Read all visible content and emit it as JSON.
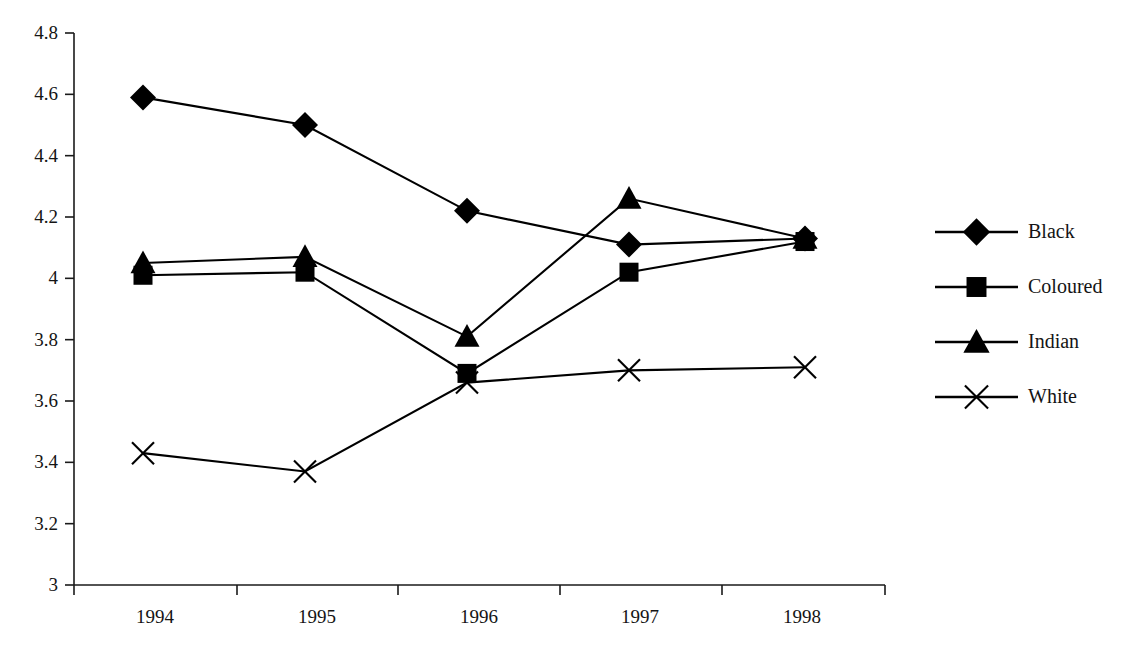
{
  "chart_data": {
    "type": "line",
    "title": "",
    "subtitle": "",
    "xlabel": "",
    "ylabel": "",
    "categories": [
      "1994",
      "1995",
      "1996",
      "1997",
      "1998"
    ],
    "x_tick_labels": [
      "1994",
      "1995",
      "1996",
      "1997",
      "1998"
    ],
    "y_tick_labels": [
      "3",
      "3.2",
      "3.4",
      "3.6",
      "3.8",
      "4",
      "4.2",
      "4.4",
      "4.6",
      "4.8"
    ],
    "y_ticks": [
      3,
      3.2,
      3.4,
      3.6,
      3.8,
      4,
      4.2,
      4.4,
      4.6,
      4.8
    ],
    "ylim": [
      3,
      4.8
    ],
    "grid": false,
    "legend_position": "right",
    "series": [
      {
        "name": "Black",
        "marker": "diamond",
        "values": [
          4.59,
          4.5,
          4.22,
          4.11,
          4.13
        ]
      },
      {
        "name": "Coloured",
        "marker": "square",
        "values": [
          4.01,
          4.02,
          3.69,
          4.02,
          4.12
        ]
      },
      {
        "name": "Indian",
        "marker": "triangle",
        "values": [
          4.05,
          4.07,
          3.81,
          4.26,
          4.13
        ]
      },
      {
        "name": "White",
        "marker": "x",
        "values": [
          3.43,
          3.37,
          3.66,
          3.7,
          3.71
        ]
      }
    ],
    "colors": {
      "series": "#000000",
      "axis": "#1a1a1a",
      "text": "#141414",
      "background": "#ffffff"
    }
  },
  "legend": {
    "items": [
      {
        "label": "Black",
        "marker": "diamond-marker-icon"
      },
      {
        "label": "Coloured",
        "marker": "square-marker-icon"
      },
      {
        "label": "Indian",
        "marker": "triangle-marker-icon"
      },
      {
        "label": "White",
        "marker": "x-marker-icon"
      }
    ]
  }
}
